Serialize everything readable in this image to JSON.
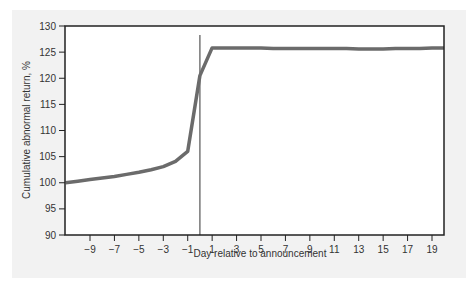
{
  "chart_data": {
    "type": "line",
    "title": "",
    "xlabel": "Day relative to announcement",
    "ylabel": "Cumulative abnormal return, %",
    "xlim": [
      -11,
      20
    ],
    "ylim": [
      90,
      130
    ],
    "x_ticks": [
      -9,
      -7,
      -5,
      -3,
      -1,
      1,
      3,
      5,
      7,
      9,
      11,
      13,
      15,
      17,
      19
    ],
    "y_ticks": [
      90,
      95,
      100,
      105,
      110,
      115,
      120,
      125,
      130
    ],
    "grid": false,
    "legend": null,
    "annotations": [
      {
        "type": "vertical_line",
        "x": 0,
        "label": "announcement day"
      }
    ],
    "series": [
      {
        "name": "Cumulative abnormal return",
        "color": "#6b6b6b",
        "x": [
          -11,
          -10,
          -9,
          -8,
          -7,
          -6,
          -5,
          -4,
          -3,
          -2,
          -1,
          0,
          1,
          2,
          3,
          4,
          5,
          6,
          7,
          8,
          9,
          10,
          11,
          12,
          13,
          14,
          15,
          16,
          17,
          18,
          19,
          20
        ],
        "values": [
          100.0,
          100.3,
          100.6,
          100.9,
          101.2,
          101.6,
          102.0,
          102.5,
          103.1,
          104.1,
          106.0,
          120.5,
          125.8,
          125.8,
          125.8,
          125.8,
          125.8,
          125.7,
          125.7,
          125.7,
          125.7,
          125.7,
          125.7,
          125.7,
          125.6,
          125.6,
          125.6,
          125.7,
          125.7,
          125.7,
          125.8,
          125.8
        ]
      }
    ]
  }
}
